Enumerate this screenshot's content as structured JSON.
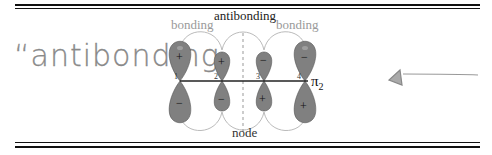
{
  "diagram": {
    "title_label": "antibonding",
    "left_label": "bonding",
    "right_label": "bonding",
    "bottom_label": "node",
    "orbital_label": "π",
    "orbital_subscript": "2",
    "atoms": [
      {
        "number": "1",
        "top_sign": "+",
        "bottom_sign": "−"
      },
      {
        "number": "2",
        "top_sign": "+",
        "bottom_sign": "−"
      },
      {
        "number": "3",
        "top_sign": "−",
        "bottom_sign": "+"
      },
      {
        "number": "4",
        "top_sign": "−",
        "bottom_sign": "+"
      }
    ],
    "lobe_color": "#808080"
  },
  "annotation": {
    "handwritten_text": "“antibonding",
    "arrow_direction": "left"
  }
}
